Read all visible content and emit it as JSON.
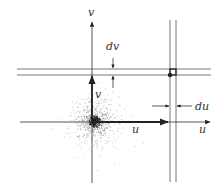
{
  "diagram": {
    "type": "coordinate-grid-with-scatter",
    "colors": {
      "line": "#555555",
      "ink": "#222222",
      "scatter": "#333333",
      "background": "#ffffff"
    },
    "axes": {
      "vertical_axis_label": "v",
      "horizontal_axis_label": "u"
    },
    "vectors": {
      "u_vector_label": "u",
      "v_vector_label": "v"
    },
    "increments": {
      "dv_label": "dv",
      "du_label": "du"
    },
    "elements": [
      "vertical axis with arrow (v)",
      "horizontal axis with arrow (u)",
      "thick vector u along horizontal axis",
      "thick vector v along vertical axis",
      "pair of horizontal lines separated by dv",
      "pair of vertical lines separated by du",
      "small area element at intersection with dot",
      "scatter point cloud centered at origin"
    ]
  }
}
